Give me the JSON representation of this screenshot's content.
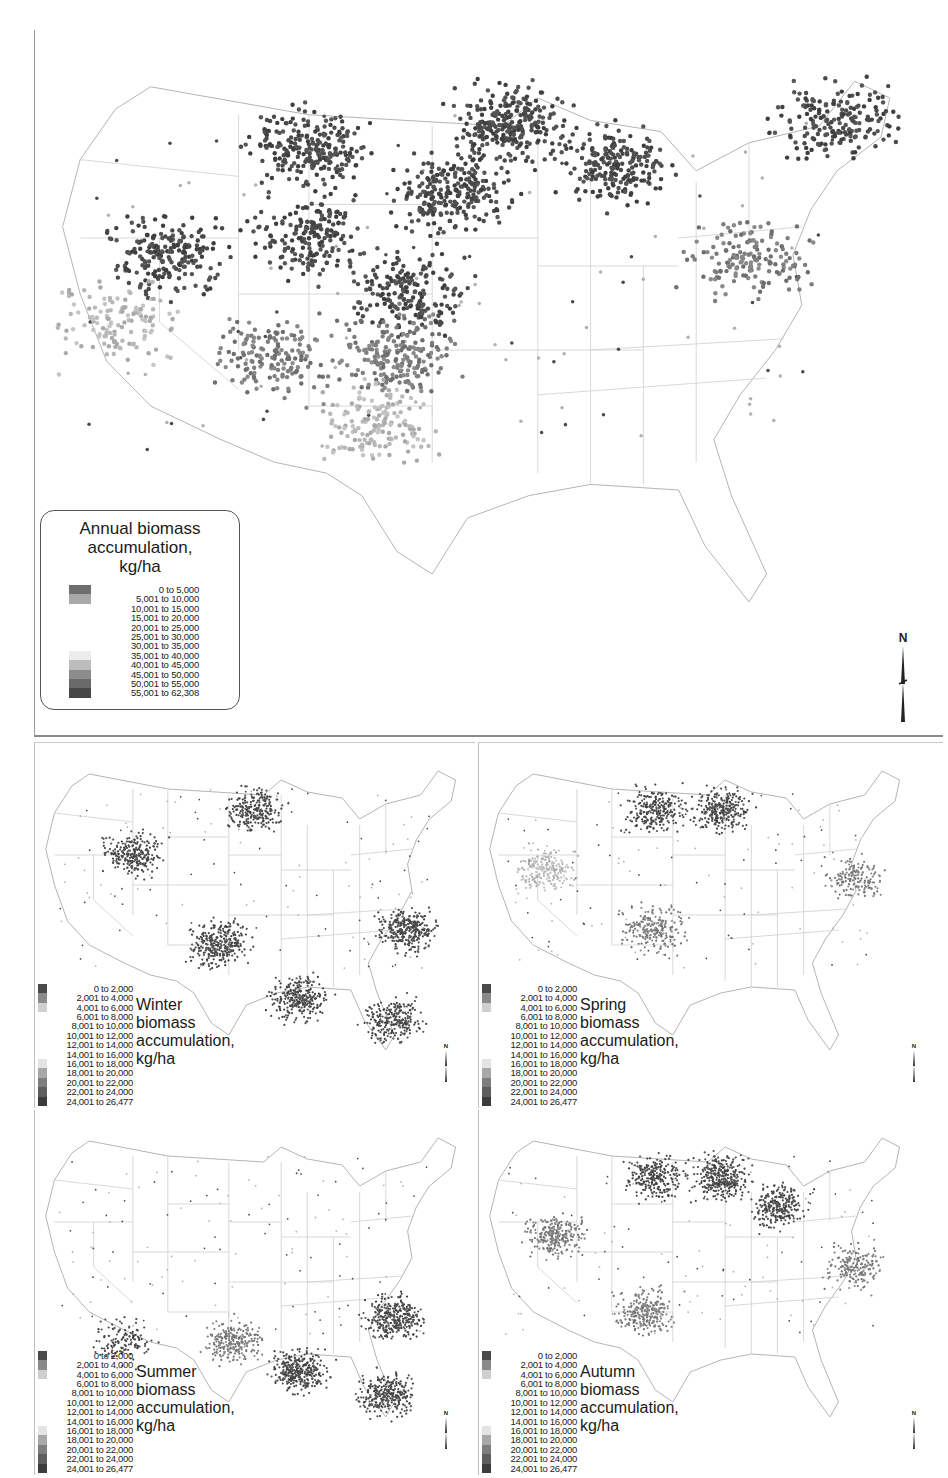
{
  "figure": {
    "annual": {
      "title_lines": [
        "Annual biomass",
        "accumulation,",
        "kg/ha"
      ],
      "legend": [
        {
          "label": "0 to   5,000",
          "color": "#6e6e6e"
        },
        {
          "label": "5,001 to 10,000",
          "color": "#a9a9a9"
        },
        {
          "label": "10,001 to 15,000",
          "color": "#ffffff"
        },
        {
          "label": "15,001 to 20,000",
          "color": "#ffffff"
        },
        {
          "label": "20,001 to 25,000",
          "color": "#ffffff"
        },
        {
          "label": "25,001 to 30,000",
          "color": "#ffffff"
        },
        {
          "label": "30,001 to 35,000",
          "color": "#ffffff"
        },
        {
          "label": "35,001 to 40,000",
          "color": "#ececec"
        },
        {
          "label": "40,001 to 45,000",
          "color": "#bdbdbd"
        },
        {
          "label": "45,001 to 50,000",
          "color": "#8c8c8c"
        },
        {
          "label": "50,001 to 55,000",
          "color": "#6a6a6a"
        },
        {
          "label": "55,001 to 62,308",
          "color": "#474747"
        }
      ],
      "north_label": "N"
    },
    "seasonal_legend": [
      {
        "label": "0 to   2,000",
        "color": "#4a4a4a"
      },
      {
        "label": "2,001 to   4,000",
        "color": "#8a8a8a"
      },
      {
        "label": "4,001 to   6,000",
        "color": "#cfcfcf"
      },
      {
        "label": "6,001 to   8,000",
        "color": "#ffffff"
      },
      {
        "label": "8,001 to 10,000",
        "color": "#ffffff"
      },
      {
        "label": "10,001 to 12,000",
        "color": "#ffffff"
      },
      {
        "label": "12,001 to 14,000",
        "color": "#ffffff"
      },
      {
        "label": "14,001 to 16,000",
        "color": "#ffffff"
      },
      {
        "label": "16,001 to 18,000",
        "color": "#e4e4e4"
      },
      {
        "label": "18,001 to 20,000",
        "color": "#a8a8a8"
      },
      {
        "label": "20,001 to 22,000",
        "color": "#7e7e7e"
      },
      {
        "label": "22,001 to 24,000",
        "color": "#5e5e5e"
      },
      {
        "label": "24,001 to 26,477",
        "color": "#3c3c3c"
      }
    ],
    "seasons": [
      {
        "key": "winter",
        "title_lines": [
          "Winter",
          "biomass",
          "accumulation,",
          "kg/ha"
        ],
        "north_label": "N"
      },
      {
        "key": "spring",
        "title_lines": [
          "Spring",
          "biomass",
          "accumulation,",
          "kg/ha"
        ],
        "north_label": "N"
      },
      {
        "key": "summer",
        "title_lines": [
          "Summer",
          "biomass",
          "accumulation,",
          "kg/ha"
        ],
        "north_label": "N"
      },
      {
        "key": "autumn",
        "title_lines": [
          "Autumn",
          "biomass",
          "accumulation,",
          "kg/ha"
        ],
        "north_label": "N"
      }
    ],
    "map_regions": {
      "annual": [
        {
          "region": "northern-plains-montana",
          "cx": 0.3,
          "cy": 0.14,
          "density": 0.9,
          "class": "dark"
        },
        {
          "region": "great-basin",
          "cx": 0.14,
          "cy": 0.33,
          "density": 0.8,
          "class": "dark"
        },
        {
          "region": "wyoming",
          "cx": 0.3,
          "cy": 0.3,
          "density": 0.7,
          "class": "dark"
        },
        {
          "region": "dakotas",
          "cx": 0.46,
          "cy": 0.22,
          "density": 0.9,
          "class": "dark"
        },
        {
          "region": "minnesota-north",
          "cx": 0.53,
          "cy": 0.1,
          "density": 1.0,
          "class": "dark"
        },
        {
          "region": "wisconsin-michigan",
          "cx": 0.65,
          "cy": 0.17,
          "density": 0.8,
          "class": "dark"
        },
        {
          "region": "nebraska-kansas-west",
          "cx": 0.41,
          "cy": 0.4,
          "density": 0.7,
          "class": "dark"
        },
        {
          "region": "southern-plains",
          "cx": 0.4,
          "cy": 0.51,
          "density": 0.8,
          "class": "mid"
        },
        {
          "region": "southwest",
          "cx": 0.26,
          "cy": 0.52,
          "density": 0.6,
          "class": "mid"
        },
        {
          "region": "texas",
          "cx": 0.38,
          "cy": 0.63,
          "density": 0.6,
          "class": "light"
        },
        {
          "region": "mid-atlantic",
          "cx": 0.8,
          "cy": 0.34,
          "density": 0.6,
          "class": "mid"
        },
        {
          "region": "new-england",
          "cx": 0.9,
          "cy": 0.09,
          "density": 0.7,
          "class": "dark"
        },
        {
          "region": "california",
          "cx": 0.08,
          "cy": 0.45,
          "density": 0.5,
          "class": "light"
        }
      ],
      "winter": [
        {
          "region": "west",
          "cx": 0.22,
          "cy": 0.3,
          "density": 0.8,
          "class": "dark"
        },
        {
          "region": "north",
          "cx": 0.5,
          "cy": 0.15,
          "density": 0.8,
          "class": "dark"
        },
        {
          "region": "southern-plains",
          "cx": 0.42,
          "cy": 0.6,
          "density": 1.0,
          "class": "dark"
        },
        {
          "region": "gulf-coast",
          "cx": 0.6,
          "cy": 0.78,
          "density": 0.9,
          "class": "dark"
        },
        {
          "region": "atlantic-coast",
          "cx": 0.85,
          "cy": 0.55,
          "density": 1.0,
          "class": "dark"
        },
        {
          "region": "florida",
          "cx": 0.82,
          "cy": 0.85,
          "density": 0.8,
          "class": "dark"
        }
      ],
      "spring": [
        {
          "region": "great-basin",
          "cx": 0.15,
          "cy": 0.35,
          "density": 0.7,
          "class": "light"
        },
        {
          "region": "north",
          "cx": 0.4,
          "cy": 0.15,
          "density": 0.8,
          "class": "dark"
        },
        {
          "region": "minnesota",
          "cx": 0.55,
          "cy": 0.15,
          "density": 0.9,
          "class": "dark"
        },
        {
          "region": "southern-plains",
          "cx": 0.4,
          "cy": 0.55,
          "density": 0.7,
          "class": "mid"
        },
        {
          "region": "mid-atlantic",
          "cx": 0.86,
          "cy": 0.38,
          "density": 0.5,
          "class": "mid"
        }
      ],
      "summer": [
        {
          "region": "southern-plains",
          "cx": 0.45,
          "cy": 0.7,
          "density": 0.8,
          "class": "mid"
        },
        {
          "region": "gulf-coast",
          "cx": 0.6,
          "cy": 0.8,
          "density": 1.0,
          "class": "dark"
        },
        {
          "region": "atlantic-coast",
          "cx": 0.82,
          "cy": 0.62,
          "density": 1.0,
          "class": "dark"
        },
        {
          "region": "florida",
          "cx": 0.8,
          "cy": 0.88,
          "density": 0.9,
          "class": "dark"
        },
        {
          "region": "southwest",
          "cx": 0.2,
          "cy": 0.7,
          "density": 0.4,
          "class": "dark"
        }
      ],
      "autumn": [
        {
          "region": "great-basin",
          "cx": 0.17,
          "cy": 0.35,
          "density": 0.8,
          "class": "mid"
        },
        {
          "region": "north",
          "cx": 0.4,
          "cy": 0.15,
          "density": 0.8,
          "class": "dark"
        },
        {
          "region": "minnesota",
          "cx": 0.55,
          "cy": 0.15,
          "density": 1.0,
          "class": "dark"
        },
        {
          "region": "michigan",
          "cx": 0.68,
          "cy": 0.25,
          "density": 0.8,
          "class": "dark"
        },
        {
          "region": "southern-plains",
          "cx": 0.38,
          "cy": 0.6,
          "density": 0.8,
          "class": "mid"
        },
        {
          "region": "mid-atlantic",
          "cx": 0.86,
          "cy": 0.45,
          "density": 0.6,
          "class": "mid"
        }
      ]
    }
  }
}
